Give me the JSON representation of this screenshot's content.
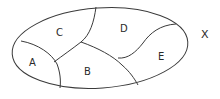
{
  "diagram": {
    "type": "venn-region-partition",
    "universal_set_label": "X",
    "regions": [
      {
        "id": "A",
        "label": "A"
      },
      {
        "id": "B",
        "label": "B"
      },
      {
        "id": "C",
        "label": "C"
      },
      {
        "id": "D",
        "label": "D"
      },
      {
        "id": "E",
        "label": "E"
      }
    ],
    "colors": {
      "line": "#3a3a3a",
      "text": "#2a2a2a",
      "background": "#ffffff"
    }
  }
}
